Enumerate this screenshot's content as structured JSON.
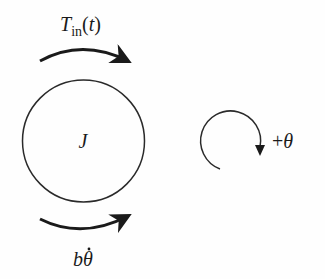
{
  "diagram": {
    "inertia_label": "J",
    "input_torque": {
      "base": "T",
      "subscript": "in",
      "argument": "(t)"
    },
    "damping_torque": {
      "base": "b",
      "variable": "θ",
      "accent": "˙"
    },
    "sign_convention": {
      "sign": "+",
      "variable": "θ"
    },
    "colors": {
      "stroke": "#1a1a1a",
      "background": "#fefefe"
    }
  }
}
